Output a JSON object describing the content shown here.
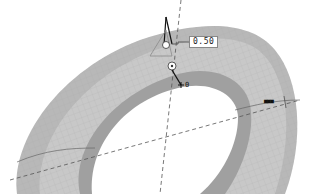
{
  "viewport": {
    "model": "torus-ring",
    "colors": {
      "background": "#ffffff",
      "surface_top": "#c6c6c6",
      "surface_inner": "#a8a8a8",
      "surface_outer_band": "#b4b4b4",
      "mesh_line": "#9c9c9c",
      "axis_line": "#555555"
    }
  },
  "annotations": {
    "dimension_value": "0.50",
    "marker_label": "0",
    "tag_label": "■■■"
  }
}
